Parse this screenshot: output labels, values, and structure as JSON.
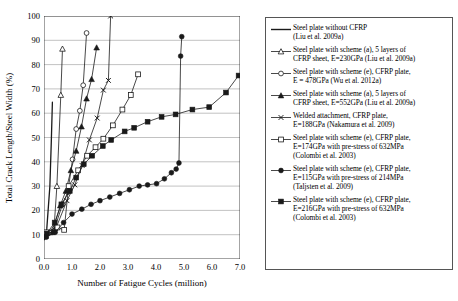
{
  "chart_data": {
    "type": "line",
    "title": "",
    "xlabel": "Number of Fatigue Cycles (million)",
    "ylabel": "Total Crack Length/Steel Width (%)",
    "xlim": [
      0.0,
      7.0
    ],
    "ylim": [
      0,
      100
    ],
    "xticks": [
      "0.0",
      "1.0",
      "2.0",
      "3.0",
      "4.0",
      "5.0",
      "6.0",
      "7.0"
    ],
    "yticks": [
      "0",
      "10",
      "20",
      "30",
      "40",
      "50",
      "60",
      "70",
      "80",
      "90",
      "100"
    ],
    "grid": "horizontal",
    "legend_position": "right-outside",
    "series": [
      {
        "name": "Steel plate without CFRP (Liu et al. 2009a)",
        "marker": "none",
        "fill": "solid-line",
        "points": [
          [
            0.02,
            8.0
          ],
          [
            0.1,
            12.5
          ],
          [
            0.21,
            30.0
          ],
          [
            0.26,
            48.0
          ],
          [
            0.3,
            64.5
          ]
        ]
      },
      {
        "name": "Steel plate with scheme (a), 5 layers of CFRP sheet, E=230GPa (Liu et al. 2009a)",
        "marker": "open-triangle",
        "fill": "open",
        "points": [
          [
            0.05,
            9.5
          ],
          [
            0.22,
            11.0
          ],
          [
            0.36,
            13.0
          ],
          [
            0.46,
            30.0
          ],
          [
            0.6,
            67.5
          ],
          [
            0.66,
            86.5
          ]
        ]
      },
      {
        "name": "Steel plate with scheme (e), CFRP plate, E = 478GPa (Wu et al. 2012a)",
        "marker": "open-circle",
        "fill": "open",
        "points": [
          [
            0.05,
            10.0
          ],
          [
            0.35,
            11.5
          ],
          [
            0.66,
            22.5
          ],
          [
            0.85,
            27.5
          ],
          [
            1.02,
            41.0
          ],
          [
            1.15,
            53.5
          ],
          [
            1.28,
            61.0
          ],
          [
            1.4,
            71.5
          ],
          [
            1.52,
            93.0
          ]
        ]
      },
      {
        "name": "Steel plate with scheme (a), 5 layers of CFRP sheet, E=552GPa (Liu et al. 2009a)",
        "marker": "filled-triangle",
        "fill": "filled",
        "points": [
          [
            0.06,
            10.5
          ],
          [
            0.3,
            11.0
          ],
          [
            0.58,
            22.0
          ],
          [
            0.78,
            28.0
          ],
          [
            0.96,
            36.5
          ],
          [
            1.15,
            44.5
          ],
          [
            1.34,
            54.5
          ],
          [
            1.52,
            66.0
          ],
          [
            1.7,
            74.0
          ],
          [
            1.88,
            87.0
          ]
        ]
      },
      {
        "name": "Welded attachment, CFRP plate, E=188GPa (Nakamura et al. 2009)",
        "marker": "cross",
        "fill": "cross",
        "points": [
          [
            0.06,
            9.5
          ],
          [
            0.42,
            12.5
          ],
          [
            0.82,
            24.0
          ],
          [
            1.1,
            30.5
          ],
          [
            1.36,
            38.5
          ],
          [
            1.62,
            49.0
          ],
          [
            1.9,
            58.0
          ],
          [
            2.12,
            69.5
          ],
          [
            2.3,
            73.5
          ],
          [
            2.38,
            100.0
          ]
        ]
      },
      {
        "name": "Steel plate with scheme (e), CFRP plate, E=174GPa with pre-stress of 632MPa (Colombi et al. 2003)",
        "marker": "open-square",
        "fill": "open",
        "points": [
          [
            0.08,
            11.0
          ],
          [
            0.48,
            13.0
          ],
          [
            0.72,
            12.0
          ],
          [
            0.88,
            30.0
          ],
          [
            1.22,
            36.5
          ],
          [
            1.54,
            42.5
          ],
          [
            1.84,
            46.0
          ],
          [
            2.12,
            49.5
          ],
          [
            2.46,
            55.0
          ],
          [
            2.8,
            61.5
          ],
          [
            3.1,
            67.5
          ],
          [
            3.36,
            76.0
          ]
        ]
      },
      {
        "name": "Steel plate with scheme (e), CFRP plate, E=115GPa with pre-stress of 214MPa (Taljsten et al. 2009)",
        "marker": "filled-circle",
        "fill": "filled",
        "points": [
          [
            0.08,
            9.0
          ],
          [
            0.4,
            11.0
          ],
          [
            0.7,
            15.0
          ],
          [
            1.0,
            18.5
          ],
          [
            1.35,
            20.5
          ],
          [
            1.68,
            22.5
          ],
          [
            2.0,
            24.0
          ],
          [
            2.35,
            25.5
          ],
          [
            2.7,
            27.0
          ],
          [
            3.05,
            28.5
          ],
          [
            3.4,
            30.0
          ],
          [
            3.7,
            30.5
          ],
          [
            4.02,
            31.0
          ],
          [
            4.3,
            33.0
          ],
          [
            4.55,
            35.5
          ],
          [
            4.72,
            37.0
          ],
          [
            4.82,
            39.5
          ],
          [
            4.88,
            83.5
          ],
          [
            4.92,
            91.5
          ]
        ]
      },
      {
        "name": "Steel plate with scheme (e), CFRP plate, E=216GPa with pre-stress of 632MPa (Colombi et al. 2003)",
        "marker": "filled-square",
        "fill": "filled",
        "points": [
          [
            0.1,
            10.5
          ],
          [
            0.38,
            15.0
          ],
          [
            0.62,
            22.5
          ],
          [
            0.92,
            28.0
          ],
          [
            1.15,
            33.5
          ],
          [
            1.42,
            39.0
          ],
          [
            1.72,
            42.5
          ],
          [
            2.1,
            46.5
          ],
          [
            2.4,
            49.0
          ],
          [
            2.88,
            52.5
          ],
          [
            3.22,
            54.0
          ],
          [
            3.7,
            56.5
          ],
          [
            4.2,
            58.5
          ],
          [
            4.7,
            59.5
          ],
          [
            5.3,
            61.5
          ],
          [
            5.9,
            62.5
          ],
          [
            6.5,
            68.5
          ],
          [
            6.95,
            75.5
          ]
        ]
      }
    ]
  },
  "legend": {
    "entries": [
      {
        "marker": "plain-line",
        "text": "Steel plate without CFRP\n(Liu et al. 2009a)"
      },
      {
        "marker": "open-triangle",
        "text": "Steel plate with scheme (a), 5 layers of\nCFRP sheet, E=230GPa (Liu et al. 2009a)"
      },
      {
        "marker": "open-circle",
        "text": "Steel plate with scheme (e), CFRP plate,\nE = 478GPa (Wu et al. 2012a)"
      },
      {
        "marker": "filled-triangle",
        "text": "Steel plate with scheme (a), 5 layers of\nCFRP sheet, E=552GPa (Liu et al. 2009a)"
      },
      {
        "marker": "cross",
        "text": "Welded attachment, CFRP plate,\nE=188GPa (Nakamura et al. 2009)"
      },
      {
        "marker": "open-square",
        "text": "Steel plate with scheme (e), CFRP plate,\nE=174GPa with pre-stress of 632MPa\n(Colombi et al. 2003)"
      },
      {
        "marker": "filled-circle",
        "text": "Steel plate with scheme (e), CFRP plate,\nE=115GPa with pre-stress of 214MPa\n(Taljsten et al. 2009)"
      },
      {
        "marker": "filled-square",
        "text": "Steel plate with scheme (e), CFRP plate,\nE=216GPa with pre-stress of 632MPa\n(Colombi et al. 2003)"
      }
    ]
  },
  "colors": {
    "line": "#1a1a1a",
    "grid": "#999999",
    "axis": "#333333",
    "background": "#ffffff",
    "legend_border": "#555555"
  }
}
